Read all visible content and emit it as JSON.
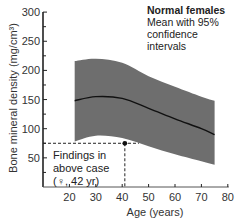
{
  "chart_data": {
    "type": "area",
    "title": "",
    "xlabel": "Age (years)",
    "ylabel": "Bone mineral density (mg/cm³)",
    "xlim": [
      10,
      80
    ],
    "ylim": [
      0,
      300
    ],
    "x_ticks": [
      20,
      30,
      40,
      50,
      60,
      70,
      80
    ],
    "y_ticks": [
      50,
      100,
      150,
      200,
      250,
      300
    ],
    "grid": false,
    "legend": {
      "title": "Normal females",
      "text": "Mean with 95% confidence intervals",
      "position": "top-right"
    },
    "series": [
      {
        "name": "Mean",
        "x": [
          22,
          30,
          40,
          50,
          60,
          70,
          75
        ],
        "values": [
          148,
          155,
          152,
          135,
          117,
          100,
          90
        ]
      },
      {
        "name": "Upper 95% CI",
        "x": [
          22,
          30,
          40,
          50,
          60,
          70,
          75
        ],
        "values": [
          216,
          220,
          213,
          190,
          172,
          155,
          148
        ]
      },
      {
        "name": "Lower 95% CI",
        "x": [
          22,
          30,
          40,
          50,
          60,
          70,
          75
        ],
        "values": [
          78,
          88,
          84,
          70,
          56,
          44,
          38
        ]
      }
    ],
    "annotation": {
      "text_lines": [
        "Findings in",
        "above case",
        "(♀, 42 yr)"
      ],
      "point": {
        "x": 41,
        "y": 75
      }
    }
  },
  "labels": {
    "ylabel": "Bone mineral density (mg/cm³)",
    "xlabel": "Age (years)",
    "legend_title": "Normal females",
    "legend_line1": "Mean with 95%",
    "legend_line2": "confidence",
    "legend_line3": "intervals",
    "annot_line1": "Findings in",
    "annot_line2": "above case",
    "annot_line3": "(♀, 42 yr)"
  },
  "colors": {
    "band": "#6e6e6e",
    "mean_line": "#111111",
    "axis": "#222222"
  }
}
